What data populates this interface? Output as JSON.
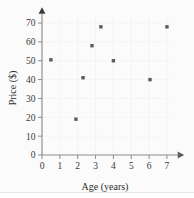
{
  "chart_data": {
    "type": "scatter",
    "title": "",
    "xlabel": "Age (years)",
    "ylabel": "Price ($)",
    "xlim": [
      0,
      7.6
    ],
    "ylim": [
      0,
      75
    ],
    "xticks": [
      0,
      1,
      2,
      3,
      4,
      5,
      6,
      7
    ],
    "xtick_labels": [
      "0",
      "1",
      "2",
      "3",
      "4",
      "5",
      "6",
      "7"
    ],
    "yticks": [
      0,
      10,
      20,
      30,
      40,
      50,
      60,
      70
    ],
    "ytick_labels": [
      "0",
      "10",
      "20",
      "30",
      "40",
      "50",
      "60",
      "70"
    ],
    "grid": true,
    "legend": false,
    "marker": "square",
    "marker_color": "#5b5b5b",
    "points": [
      {
        "x": 0.5,
        "y": 50.5
      },
      {
        "x": 1.9,
        "y": 19.0
      },
      {
        "x": 2.3,
        "y": 41.0
      },
      {
        "x": 2.8,
        "y": 58.0
      },
      {
        "x": 3.3,
        "y": 68.0
      },
      {
        "x": 4.0,
        "y": 50.0
      },
      {
        "x": 6.05,
        "y": 40.0
      },
      {
        "x": 7.0,
        "y": 68.0
      }
    ]
  },
  "figure": {
    "background_color": "#fbfbfb",
    "axis_color": "#8d8d8d",
    "text_color": "#3a3a3a"
  }
}
